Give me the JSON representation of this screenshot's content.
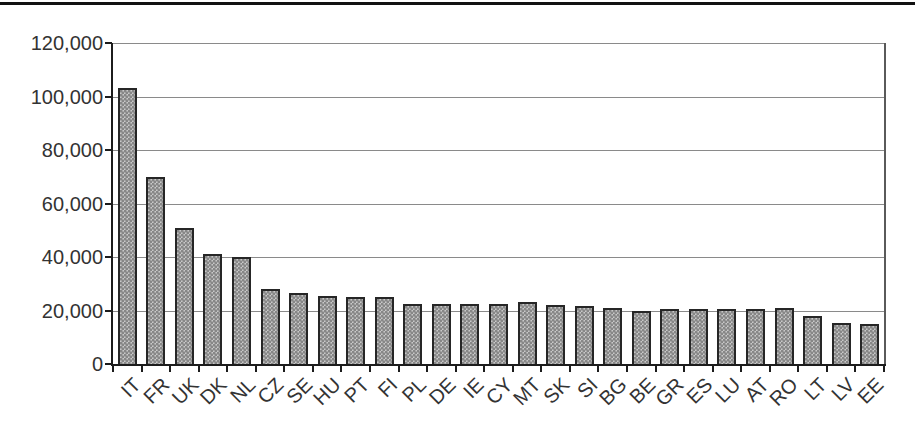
{
  "style": {
    "background": "#ffffff",
    "top_rule_color": "#111111",
    "bar_fill": "#c9c9c9",
    "bar_dot_color": "#878787",
    "bar_border_color": "#262626",
    "gridline_color": "#8a8a8a",
    "axis_color": "#1c1c1c",
    "label_color": "#333333"
  },
  "chart_data": {
    "type": "bar",
    "title": "",
    "xlabel": "",
    "ylabel": "",
    "categories": [
      "IT",
      "FR",
      "UK",
      "DK",
      "NL",
      "CZ",
      "SE",
      "HU",
      "PT",
      "FI",
      "PL",
      "DE",
      "IE",
      "CY",
      "MT",
      "SK",
      "SI",
      "BG",
      "BE",
      "GR",
      "ES",
      "LU",
      "AT",
      "RO",
      "LT",
      "LV",
      "EE"
    ],
    "values": [
      103000,
      70000,
      51000,
      41000,
      40000,
      28000,
      26500,
      25500,
      25000,
      25000,
      22500,
      22500,
      22500,
      22500,
      23000,
      22000,
      21500,
      21000,
      20000,
      20500,
      20500,
      20500,
      20500,
      21000,
      18000,
      15500,
      15000
    ],
    "ylim": [
      0,
      120000
    ],
    "ytick_interval": 20000,
    "yticks": [
      0,
      20000,
      40000,
      60000,
      80000,
      100000,
      120000
    ],
    "ytick_labels": [
      "0",
      "20,000",
      "40,000",
      "60,000",
      "80,000",
      "100,000",
      "120,000"
    ],
    "grid": true,
    "legend": false
  }
}
